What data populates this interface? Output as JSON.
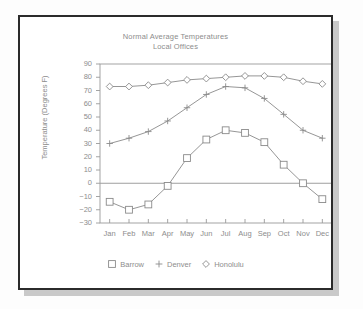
{
  "chart_data": {
    "type": "line",
    "title": "Normal Average Temperatures",
    "subtitle": "Local Offices",
    "xlabel": "",
    "ylabel": "Temperature (Degrees F)",
    "categories": [
      "Jan",
      "Feb",
      "Mar",
      "Apr",
      "May",
      "Jun",
      "Jul",
      "Aug",
      "Sep",
      "Oct",
      "Nov",
      "Dec"
    ],
    "ylim": [
      -30,
      90
    ],
    "ytick_step": 10,
    "yticks": [
      90,
      80,
      70,
      60,
      50,
      40,
      30,
      20,
      10,
      0,
      -10,
      -20,
      -30
    ],
    "grid": false,
    "zero_line": true,
    "legend_position": "bottom",
    "series": [
      {
        "name": "Barrow",
        "marker": "square",
        "values": [
          -14,
          -20,
          -16,
          -2,
          19,
          33,
          40,
          38,
          31,
          14,
          0,
          -12
        ]
      },
      {
        "name": "Denver",
        "marker": "plus",
        "values": [
          30,
          34,
          39,
          47,
          57,
          67,
          73,
          72,
          64,
          52,
          40,
          34
        ]
      },
      {
        "name": "Honolulu",
        "marker": "diamond",
        "values": [
          73,
          73,
          74,
          76,
          78,
          79,
          80,
          81,
          81,
          80,
          77,
          75
        ]
      }
    ]
  },
  "legend": {
    "items": [
      {
        "label": "Barrow",
        "marker": "square"
      },
      {
        "label": "Denver",
        "marker": "plus"
      },
      {
        "label": "Honolulu",
        "marker": "diamond"
      }
    ]
  },
  "colors": {
    "line": "#8a8a8a",
    "text": "#8d8d8d",
    "frame": "#2b2b2b",
    "axis": "#9a9a9a",
    "shadow": "#c9c9c9",
    "background": "#ffffff"
  }
}
